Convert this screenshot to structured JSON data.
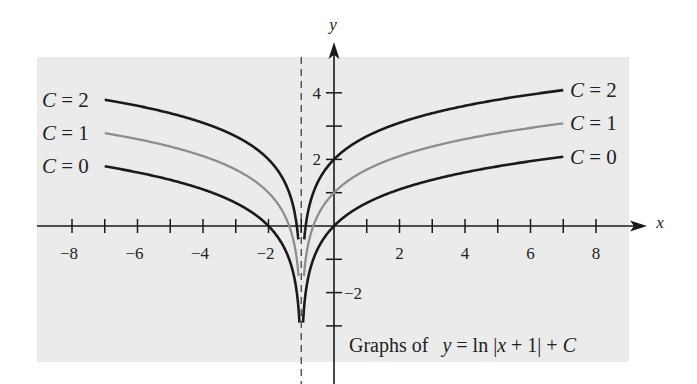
{
  "chart_data": {
    "type": "line",
    "title": "",
    "caption": {
      "prefix": "Graphs of",
      "y": "y",
      "eq1": " = ln |",
      "x": "x",
      "eq2": " + 1| + ",
      "C": "C"
    },
    "xlabel": "x",
    "ylabel": "y",
    "xlim": [
      -9,
      9
    ],
    "ylim": [
      -3.5,
      5
    ],
    "x_ticks": [
      -8,
      -7,
      -6,
      -5,
      -4,
      -3,
      -2,
      -1,
      1,
      2,
      3,
      4,
      5,
      6,
      7,
      8
    ],
    "x_tick_labels": [
      {
        "value": -8,
        "label": "−8"
      },
      {
        "value": -6,
        "label": "−6"
      },
      {
        "value": -4,
        "label": "−4"
      },
      {
        "value": -2,
        "label": "−2"
      },
      {
        "value": 2,
        "label": "2"
      },
      {
        "value": 4,
        "label": "4"
      },
      {
        "value": 6,
        "label": "6"
      },
      {
        "value": 8,
        "label": "8"
      }
    ],
    "y_ticks": [
      -3,
      -2,
      -1,
      1,
      2,
      3,
      4
    ],
    "y_tick_labels": [
      {
        "value": 4,
        "label": "4",
        "side": "left"
      },
      {
        "value": 2,
        "label": "2",
        "side": "left"
      },
      {
        "value": -2,
        "label": "−2",
        "side": "right"
      }
    ],
    "asymptote": {
      "x": -1,
      "style": "dashed"
    },
    "function": "y = ln|x + 1| + C",
    "x_domain_left": [
      -7,
      -1
    ],
    "x_domain_right": [
      -1,
      7
    ],
    "series": [
      {
        "name": "C = 2",
        "C": 2,
        "color": "#1a1a1a",
        "width": 2.6,
        "y_min": -0.4,
        "points_sample": [
          [
            -7,
            3.79
          ],
          [
            -3,
            2.69
          ],
          [
            -2,
            2.0
          ],
          [
            0,
            2.0
          ],
          [
            1,
            2.69
          ],
          [
            3,
            3.39
          ],
          [
            7,
            4.08
          ]
        ]
      },
      {
        "name": "C = 1",
        "C": 1,
        "color": "#8e8e8e",
        "width": 2.3,
        "y_min": -1.5,
        "points_sample": [
          [
            -7,
            2.79
          ],
          [
            -3,
            1.69
          ],
          [
            -2,
            1.0
          ],
          [
            0,
            1.0
          ],
          [
            1,
            1.69
          ],
          [
            3,
            2.39
          ],
          [
            7,
            3.08
          ]
        ]
      },
      {
        "name": "C = 0",
        "C": 0,
        "color": "#1a1a1a",
        "width": 2.6,
        "y_min": -2.9,
        "points_sample": [
          [
            -7,
            1.79
          ],
          [
            -3,
            0.69
          ],
          [
            -2,
            0.0
          ],
          [
            0,
            0.0
          ],
          [
            1,
            0.69
          ],
          [
            3,
            1.39
          ],
          [
            7,
            2.08
          ]
        ]
      }
    ],
    "legend": {
      "left_labels": [
        "C = 2",
        "C = 1",
        "C = 0"
      ],
      "right_labels": [
        "C = 2",
        "C = 1",
        "C = 0"
      ],
      "position": "curve ends (both sides)"
    },
    "grid": false,
    "background": "#ebebeb"
  }
}
